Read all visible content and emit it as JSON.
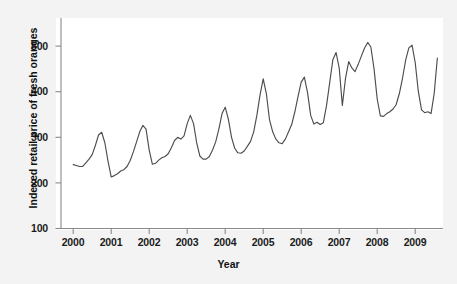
{
  "figure": {
    "background_color": "#f3f3f3",
    "panel_color": "#ffffff",
    "line_color": "#4d4d4d",
    "axis_color": "#808080",
    "text_color": "#111111"
  },
  "axes": {
    "xlabel": "Year",
    "ylabel": "Indexed retail price of fresh oranges",
    "xticks": [
      "2000",
      "2001",
      "2002",
      "2003",
      "2004",
      "2005",
      "2006",
      "2007",
      "2008",
      "2009"
    ],
    "yticks": [
      "100",
      "200",
      "300",
      "400",
      "500"
    ]
  },
  "chart_data": {
    "type": "line",
    "title": "",
    "xlabel": "Year",
    "ylabel": "Indexed retail price of fresh oranges",
    "xlim": [
      1999.75,
      2009.8
    ],
    "ylim": [
      100,
      530
    ],
    "grid": false,
    "legend": null,
    "x_tick_values": [
      2000,
      2001,
      2002,
      2003,
      2004,
      2005,
      2006,
      2007,
      2008,
      2009
    ],
    "x_tick_labels": [
      "2000",
      "2001",
      "2002",
      "2003",
      "2004",
      "2005",
      "2006",
      "2007",
      "2008",
      "2009"
    ],
    "y_tick_values": [
      100,
      200,
      300,
      400,
      500
    ],
    "y_tick_labels": [
      "100",
      "200",
      "300",
      "400",
      "500"
    ],
    "series": [
      {
        "name": "Indexed retail price of fresh oranges",
        "color": "#4d4d4d",
        "x": [
          2000.0,
          2000.083,
          2000.167,
          2000.25,
          2000.333,
          2000.417,
          2000.5,
          2000.583,
          2000.667,
          2000.75,
          2000.833,
          2000.917,
          2001.0,
          2001.083,
          2001.167,
          2001.25,
          2001.333,
          2001.417,
          2001.5,
          2001.583,
          2001.667,
          2001.75,
          2001.833,
          2001.917,
          2002.0,
          2002.083,
          2002.167,
          2002.25,
          2002.333,
          2002.417,
          2002.5,
          2002.583,
          2002.667,
          2002.75,
          2002.833,
          2002.917,
          2003.0,
          2003.083,
          2003.167,
          2003.25,
          2003.333,
          2003.417,
          2003.5,
          2003.583,
          2003.667,
          2003.75,
          2003.833,
          2003.917,
          2004.0,
          2004.083,
          2004.167,
          2004.25,
          2004.333,
          2004.417,
          2004.5,
          2004.583,
          2004.667,
          2004.75,
          2004.833,
          2004.917,
          2005.0,
          2005.083,
          2005.167,
          2005.25,
          2005.333,
          2005.417,
          2005.5,
          2005.583,
          2005.667,
          2005.75,
          2005.833,
          2005.917,
          2006.0,
          2006.083,
          2006.167,
          2006.25,
          2006.333,
          2006.417,
          2006.5,
          2006.583,
          2006.667,
          2006.75,
          2006.833,
          2006.917,
          2007.0,
          2007.083,
          2007.167,
          2007.25,
          2007.333,
          2007.417,
          2007.5,
          2007.583,
          2007.667,
          2007.75,
          2007.833,
          2007.917,
          2008.0,
          2008.083,
          2008.167,
          2008.25,
          2008.333,
          2008.417,
          2008.5,
          2008.583,
          2008.667,
          2008.75,
          2008.833,
          2008.917,
          2009.0,
          2009.083,
          2009.167,
          2009.25,
          2009.333,
          2009.417,
          2009.5,
          2009.583
        ],
        "y": [
          240,
          238,
          236,
          236,
          244,
          252,
          262,
          282,
          305,
          311,
          288,
          247,
          213,
          216,
          220,
          226,
          229,
          236,
          249,
          268,
          290,
          312,
          326,
          318,
          272,
          241,
          243,
          250,
          255,
          258,
          264,
          277,
          293,
          300,
          296,
          303,
          330,
          348,
          330,
          288,
          259,
          252,
          252,
          258,
          272,
          290,
          318,
          352,
          366,
          340,
          300,
          276,
          266,
          265,
          270,
          280,
          291,
          312,
          348,
          393,
          428,
          396,
          338,
          312,
          296,
          288,
          286,
          296,
          312,
          328,
          356,
          390,
          421,
          432,
          398,
          348,
          329,
          333,
          328,
          332,
          370,
          420,
          470,
          486,
          452,
          370,
          430,
          466,
          452,
          444,
          460,
          478,
          496,
          508,
          498,
          450,
          384,
          347,
          346,
          352,
          356,
          362,
          372,
          396,
          430,
          470,
          496,
          502,
          464,
          400,
          360,
          354,
          356,
          352,
          396,
          474
        ]
      }
    ]
  }
}
